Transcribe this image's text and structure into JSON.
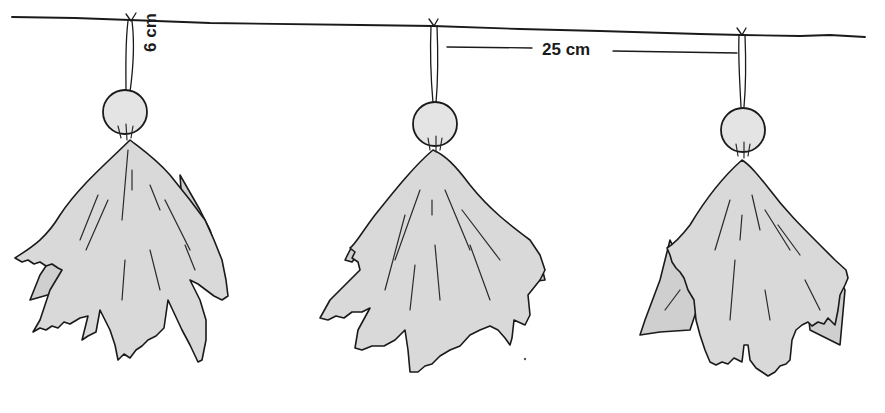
{
  "figure": {
    "annotations": {
      "hanging_length": "6 cm",
      "spacing": "25 cm"
    },
    "figures": [
      {
        "name": "ghost-1",
        "x": 130
      },
      {
        "name": "ghost-2",
        "x": 433
      },
      {
        "name": "ghost-3",
        "x": 742
      }
    ],
    "colors": {
      "ink": "#1a1a1a",
      "cloth": "#d9d9d9",
      "background": "#ffffff"
    }
  }
}
